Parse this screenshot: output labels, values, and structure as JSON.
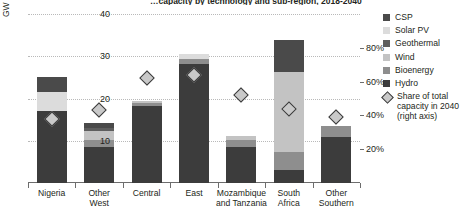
{
  "title": "…capacity by technology and sub-region, 2018-2040",
  "axes": {
    "left_title": "GW",
    "left_ticks": [
      "10",
      "20",
      "30",
      "40"
    ],
    "right_ticks": [
      "20%",
      "40%",
      "60%",
      "80%"
    ]
  },
  "legend": {
    "items": [
      {
        "label": "CSP",
        "color": "#4a4a4a",
        "icon": "square-swatch"
      },
      {
        "label": "Solar PV",
        "color": "#dcdcdc",
        "icon": "square-swatch"
      },
      {
        "label": "Geothermal",
        "color": "#5e5e5e",
        "icon": "square-swatch"
      },
      {
        "label": "Wind",
        "color": "#c3c3c3",
        "icon": "square-swatch"
      },
      {
        "label": "Bioenergy",
        "color": "#8e8e8e",
        "icon": "square-swatch"
      },
      {
        "label": "Hydro",
        "color": "#3c3c3c",
        "icon": "square-swatch"
      }
    ],
    "marker": {
      "label_line1": "Share of total",
      "label_line2": "capacity in 2040",
      "label_line3": "(right axis)",
      "icon": "diamond-marker",
      "color": "#c9c9c9"
    }
  },
  "chart_data": {
    "type": "bar",
    "title": "…capacity by technology and sub-region, 2018-2040",
    "xlabel": "",
    "ylabel": "GW",
    "ylim": [
      0,
      40
    ],
    "y2label": "Share of total capacity in 2040",
    "y2lim": [
      0,
      100
    ],
    "grid": true,
    "legend_position": "right",
    "stacked": true,
    "categories": [
      "Nigeria",
      "Other West",
      "Central",
      "East",
      "Mozambique and Tanzania",
      "South Africa",
      "Other Southern"
    ],
    "series": [
      {
        "name": "Hydro",
        "color": "#3c3c3c",
        "values": [
          17.0,
          8.6,
          18.3,
          28.2,
          8.6,
          3.0,
          11.0
        ]
      },
      {
        "name": "Bioenergy",
        "color": "#8e8e8e",
        "values": [
          0.0,
          1.6,
          0.6,
          1.1,
          1.7,
          4.3,
          2.5
        ]
      },
      {
        "name": "Wind",
        "color": "#c3c3c3",
        "values": [
          0.0,
          2.1,
          0.6,
          0.0,
          0.9,
          19.0,
          0.0
        ]
      },
      {
        "name": "Geothermal",
        "color": "#5e5e5e",
        "values": [
          0.0,
          0.8,
          0.0,
          0.0,
          0.0,
          0.0,
          0.0
        ]
      },
      {
        "name": "Solar PV",
        "color": "#dcdcdc",
        "values": [
          4.6,
          0.0,
          0.0,
          1.2,
          0.0,
          0.0,
          0.0
        ]
      },
      {
        "name": "CSP",
        "color": "#4a4a4a",
        "values": [
          3.4,
          1.1,
          0.0,
          0.0,
          0.0,
          7.5,
          0.0
        ]
      }
    ],
    "marker_series": {
      "name": "Share of total capacity in 2040",
      "axis": "right",
      "values": [
        38,
        43,
        62,
        64,
        52,
        44,
        39
      ]
    }
  }
}
